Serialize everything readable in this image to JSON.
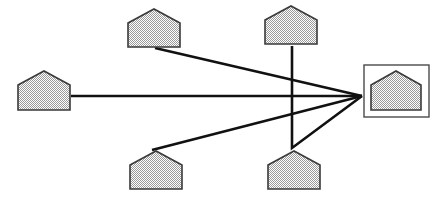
{
  "diagram": {
    "title": "Star network of houses converging on a highlighted house",
    "type": "node-link-diagram",
    "canvas": {
      "width": 443,
      "height": 197,
      "background": "#ffffff"
    },
    "style": {
      "node_fill": "#d9d9d9",
      "node_stroke": "#3a3a3a",
      "node_fill_pattern": "dither-50-gray",
      "link_stroke": "#111111",
      "link_stroke_width": 2.6,
      "highlight_box_stroke": "#4a4a4a"
    },
    "hub": {
      "id": "house-hub",
      "label": "hub-house",
      "highlighted": true,
      "x": 371,
      "y": 71,
      "width": 50,
      "height": 39,
      "roof_height": 14,
      "box": {
        "x": 364,
        "y": 65,
        "width": 65,
        "height": 52
      },
      "connection_point": {
        "x": 362,
        "y": 96
      }
    },
    "nodes": [
      {
        "id": "house-top-left",
        "label": "top-left-house",
        "x": 128,
        "y": 9,
        "width": 52,
        "height": 38,
        "roof_height": 14
      },
      {
        "id": "house-top-right",
        "label": "top-right-house",
        "x": 265,
        "y": 6,
        "width": 52,
        "height": 38,
        "roof_height": 14
      },
      {
        "id": "house-left",
        "label": "left-house",
        "x": 18,
        "y": 71,
        "width": 52,
        "height": 39,
        "roof_height": 14
      },
      {
        "id": "house-bottom-left",
        "label": "bottom-left-house",
        "x": 130,
        "y": 151,
        "width": 52,
        "height": 38,
        "roof_height": 14
      },
      {
        "id": "house-bottom-right",
        "label": "bottom-right-house",
        "x": 268,
        "y": 151,
        "width": 52,
        "height": 38,
        "roof_height": 14
      }
    ],
    "links": [
      {
        "id": "link-top-left",
        "label": "top-left-to-hub",
        "from": "house-top-left",
        "to": "house-hub",
        "points": "155,48 362,96"
      },
      {
        "id": "link-left",
        "label": "left-to-hub",
        "from": "house-left",
        "to": "house-hub",
        "points": "71,96 362,96"
      },
      {
        "id": "link-bottom-left",
        "label": "bottom-left-to-hub",
        "from": "house-bottom-left",
        "to": "house-hub",
        "points": "152,150 362,96"
      },
      {
        "id": "link-top-right",
        "label": "top-right-to-hub-via-elbow",
        "from": "house-top-right",
        "to": "house-hub",
        "points": "292,46 292,148 362,96"
      }
    ]
  }
}
